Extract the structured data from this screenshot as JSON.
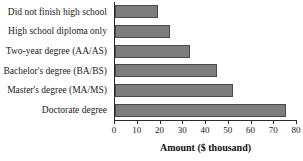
{
  "chart_data": {
    "type": "bar",
    "orientation": "horizontal",
    "title": "",
    "xlabel": "Amount ($ thousand)",
    "ylabel": "",
    "categories": [
      "Did not finish high school",
      "High school diploma only",
      "Two-year degree (AA/AS)",
      "Bachelor's degree (BA/BS)",
      "Master's degree (MA/MS)",
      "Doctorate degree"
    ],
    "values": [
      19,
      24,
      33,
      45,
      52,
      75
    ],
    "xlim": [
      0,
      80
    ],
    "xticks": [
      0,
      10,
      20,
      30,
      40,
      50,
      60,
      70,
      80
    ],
    "xtick_labels": [
      "0",
      "10",
      "20",
      "30",
      "40",
      "50",
      "60",
      "70",
      "80"
    ],
    "grid": false,
    "legend": false,
    "bar_color": "#7d7d7d",
    "bar_border_color": "#4a4a4a",
    "axis_color": "#2b2b2b"
  }
}
